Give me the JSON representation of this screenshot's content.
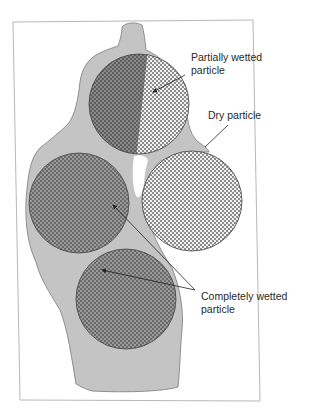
{
  "diagram": {
    "labels": {
      "partial": {
        "line1": "Partially wetted",
        "line2": "particle"
      },
      "dry": {
        "line1": "Dry particle"
      },
      "complete": {
        "line1": "Completely wetted",
        "line2": "particle"
      }
    },
    "colors": {
      "liquid": "#c4c4c4",
      "liquid_outline": "#7a7a7a",
      "particle_dark": "#6f6f6f",
      "particle_light": "#d8d8d8",
      "frame": "#b8b8b8",
      "text": "#2a2a2a"
    },
    "particles": [
      {
        "name": "partially-wetted",
        "state": "partially wetted"
      },
      {
        "name": "completely-wetted-left",
        "state": "completely wetted"
      },
      {
        "name": "dry",
        "state": "dry"
      },
      {
        "name": "completely-wetted-bottom",
        "state": "completely wetted"
      }
    ]
  }
}
